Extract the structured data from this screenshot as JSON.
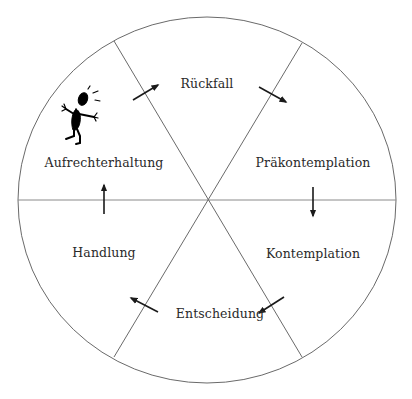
{
  "diagram": {
    "colors": {
      "line": "#6a6a6a",
      "arrow": "#1a1a1a",
      "figure": "#000000",
      "text": "#2a2a2a",
      "background": "#ffffff"
    },
    "stages": [
      {
        "id": "rueckfall",
        "label": "Rückfall",
        "x": 207,
        "y": 76
      },
      {
        "id": "praekontemplation",
        "label": "Präkontemplation",
        "x": 313,
        "y": 155
      },
      {
        "id": "kontemplation",
        "label": "Kontemplation",
        "x": 313,
        "y": 246
      },
      {
        "id": "entscheidung",
        "label": "Entscheidung",
        "x": 220,
        "y": 306
      },
      {
        "id": "handlung",
        "label": "Handlung",
        "x": 104,
        "y": 245
      },
      {
        "id": "aufrechterhaltung",
        "label": "Aufrechterhaltung",
        "x": 104,
        "y": 155
      }
    ],
    "figure": {
      "icon": "stressed-stick-figure-icon",
      "position": "aufrechterhaltung-segment"
    }
  }
}
